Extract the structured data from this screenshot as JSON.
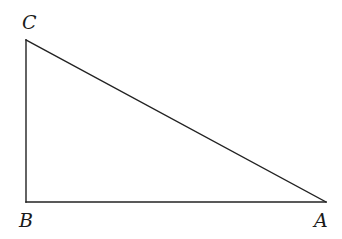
{
  "diagram": {
    "type": "right-triangle",
    "background": "#ffffff",
    "stroke_color": "#222222",
    "vertices": [
      {
        "id": "C",
        "label": "C",
        "x": 26,
        "y": 40,
        "label_x": 22,
        "label_y": 29
      },
      {
        "id": "B",
        "label": "B",
        "x": 26,
        "y": 202,
        "label_x": 19,
        "label_y": 227
      },
      {
        "id": "A",
        "label": "A",
        "x": 326,
        "y": 202,
        "label_x": 314,
        "label_y": 227
      }
    ],
    "edges": [
      {
        "from": "C",
        "to": "B",
        "name": "side-CB"
      },
      {
        "from": "B",
        "to": "A",
        "name": "side-BA"
      },
      {
        "from": "A",
        "to": "C",
        "name": "hypotenuse-AC"
      }
    ],
    "right_angle_at": "B"
  }
}
